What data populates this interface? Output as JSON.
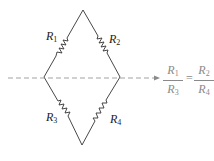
{
  "diagram": {
    "type": "wheatstone-bridge",
    "resistors": [
      {
        "id": "R1",
        "letter": "R",
        "sub": "1",
        "branch": "top-left"
      },
      {
        "id": "R2",
        "letter": "R",
        "sub": "2",
        "branch": "top-right"
      },
      {
        "id": "R3",
        "letter": "R",
        "sub": "3",
        "branch": "bottom-left"
      },
      {
        "id": "R4",
        "letter": "R",
        "sub": "4",
        "branch": "bottom-right"
      }
    ],
    "colors": {
      "wire": "#333333",
      "dashed_line": "#8a8a8a",
      "equation": "#8a8a8a"
    },
    "equation": {
      "left": {
        "num_letter": "R",
        "num_sub": "1",
        "den_letter": "R",
        "den_sub": "3"
      },
      "sign": "=",
      "right": {
        "num_letter": "R",
        "num_sub": "2",
        "den_letter": "R",
        "den_sub": "4"
      }
    }
  }
}
